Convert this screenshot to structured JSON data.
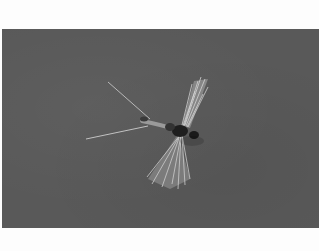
{
  "image": {
    "subject": "dry fly (mayfly spinner pattern) on gray background",
    "background_color": "#595959",
    "page_color": "#fdfdfd"
  }
}
